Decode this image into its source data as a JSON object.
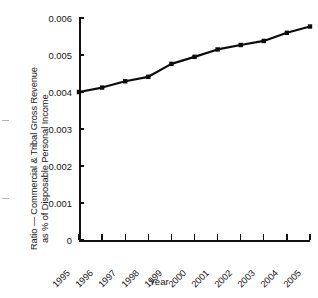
{
  "figure": {
    "background_color": "#ffffff",
    "line_color": "#0b0b0b",
    "marker_color": "#0b0b0b",
    "axis_color": "#111111"
  },
  "axes": {
    "y_label_line1": "Ratio — Commercial & Tribal Gross Revenue",
    "y_label_line2": "as % of Disposable Personal Income",
    "x_label": "Year",
    "y_ticks": [
      "0",
      "0.001",
      "0.002",
      "0.003",
      "0.004",
      "0.005",
      "0.006"
    ],
    "x_ticks": [
      "1995",
      "1996",
      "1997",
      "1998",
      "1999",
      "2000",
      "2001",
      "2002",
      "2003",
      "2004",
      "2005"
    ]
  },
  "chart_data": {
    "type": "line",
    "title": "",
    "xlabel": "Year",
    "ylabel": "Ratio — Commercial & Tribal Gross Revenue as % of Disposable Personal Income",
    "categories": [
      "1995",
      "1996",
      "1997",
      "1998",
      "1999",
      "2000",
      "2001",
      "2002",
      "2003",
      "2004",
      "2005"
    ],
    "x": [
      1995,
      1996,
      1997,
      1998,
      1999,
      2000,
      2001,
      2002,
      2003,
      2004,
      2005
    ],
    "values": [
      0.004,
      0.00412,
      0.00429,
      0.00441,
      0.00476,
      0.00495,
      0.00515,
      0.00527,
      0.00538,
      0.0056,
      0.00577
    ],
    "series": [
      {
        "name": "Ratio — Commercial & Tribal Gross Revenue as % of Disposable Personal Income",
        "values": [
          0.004,
          0.00412,
          0.00429,
          0.00441,
          0.00476,
          0.00495,
          0.00515,
          0.00527,
          0.00538,
          0.0056,
          0.00577
        ]
      }
    ],
    "ylim": [
      0,
      0.006
    ],
    "ytick_values": [
      0,
      0.001,
      0.002,
      0.003,
      0.004,
      0.005,
      0.006
    ],
    "grid": false,
    "legend": false,
    "marker": "square",
    "xtick_rotation": -45
  }
}
